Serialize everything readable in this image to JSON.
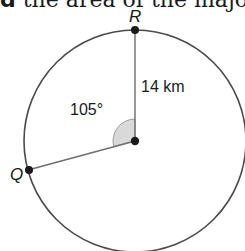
{
  "header": {
    "bold_fragment": "d",
    "text_fragment": " the area of the majo"
  },
  "diagram": {
    "circle": {
      "cx": 135,
      "cy": 141,
      "r": 111,
      "stroke": "#4a4a4a"
    },
    "center": {
      "x": 135,
      "y": 141
    },
    "points": [
      {
        "name": "R",
        "x": 135,
        "y": 30
      },
      {
        "name": "Q",
        "x": 28,
        "y": 170
      }
    ],
    "radius_label": "14 km",
    "angle_label": "105°",
    "angle_degrees": 105,
    "angle_fill": "#d9d9d9",
    "line_color": "#6e6e6e",
    "dot_color": "#1a1a1a"
  }
}
